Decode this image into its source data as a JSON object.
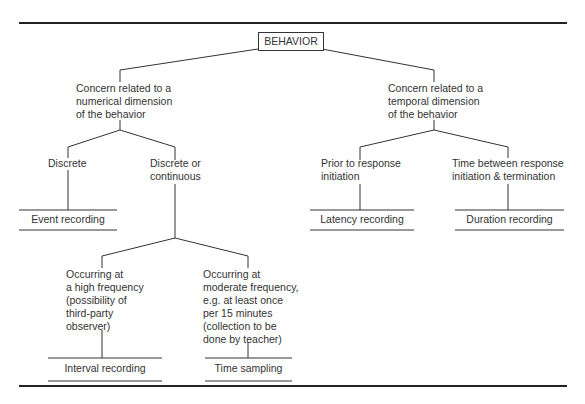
{
  "diagram": {
    "root": "BEHAVIOR",
    "branches": {
      "numerical": "Concern related to a\nnumerical dimension\nof the behavior",
      "temporal": "Concern related to a\ntemporal dimension\nof the behavior"
    },
    "numerical_children": {
      "discrete": "Discrete",
      "discrete_or_continuous": "Discrete or\ncontinuous"
    },
    "frequency_children": {
      "high": "Occurring at\na high frequency\n(possibility of\nthird-party\nobserver)",
      "moderate": "Occurring at\nmoderate frequency,\ne.g. at least once\nper 15 minutes\n(collection to be\ndone by teacher)"
    },
    "temporal_children": {
      "prior": "Prior to response\ninitiation",
      "between": "Time between response\ninitiation & termination"
    },
    "methods": {
      "event": "Event recording",
      "interval": "Interval recording",
      "time_sampling": "Time sampling",
      "latency": "Latency recording",
      "duration": "Duration recording"
    }
  }
}
